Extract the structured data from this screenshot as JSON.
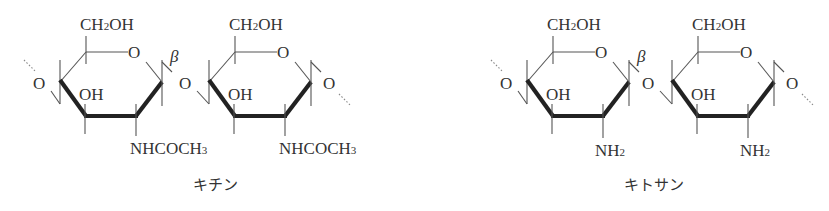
{
  "diagram": {
    "structures": [
      {
        "name": "chitin",
        "caption": "キチン",
        "offset_x": 0,
        "units": [
          {
            "top_group": "CH2OH",
            "ring_o": "O",
            "oh": "OH",
            "c2_group_main": "NHCOCH",
            "c2_group_sub": "3"
          },
          {
            "top_group": "CH2OH",
            "ring_o": "O",
            "oh": "OH",
            "c2_group_main": "NHCOCH",
            "c2_group_sub": "3"
          }
        ],
        "linkage_o": [
          "O",
          "O",
          "O"
        ],
        "beta_label": "β"
      },
      {
        "name": "chitosan",
        "caption": "キトサン",
        "offset_x": 467,
        "units": [
          {
            "top_group": "CH2OH",
            "ring_o": "O",
            "oh": "OH",
            "c2_group_main": "NH",
            "c2_group_sub": "2"
          },
          {
            "top_group": "CH2OH",
            "ring_o": "O",
            "oh": "OH",
            "c2_group_main": "NH",
            "c2_group_sub": "2"
          }
        ],
        "linkage_o": [
          "O",
          "O",
          "O"
        ],
        "beta_label": "β"
      }
    ],
    "ch2oh": {
      "c": "CH",
      "sub": "2",
      "oh": "OH"
    }
  }
}
